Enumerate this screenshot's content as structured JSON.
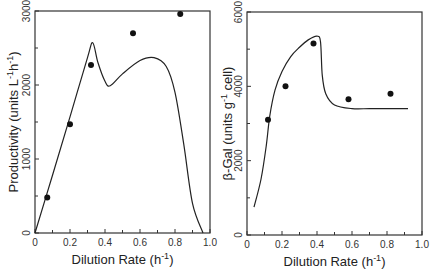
{
  "chart_data": [
    {
      "type": "line",
      "title": "",
      "xlabel": "Dilution Rate (h⁻¹)",
      "ylabel": "Productivity (units L⁻¹h⁻¹)",
      "xlim": [
        0,
        1.0
      ],
      "ylim": [
        0,
        3000
      ],
      "xticks": [
        "0",
        "0.2",
        "0.4",
        "0.6",
        "0.8",
        "1.0"
      ],
      "yticks": [
        "0",
        "1000",
        "2000",
        "3000"
      ],
      "grid": false,
      "series": [
        {
          "name": "model curve",
          "kind": "line",
          "x": [
            0,
            0.1,
            0.2,
            0.3,
            0.33,
            0.36,
            0.4,
            0.43,
            0.5,
            0.6,
            0.68,
            0.75,
            0.8,
            0.85,
            0.9,
            0.96
          ],
          "y": [
            0,
            780,
            1570,
            2370,
            2570,
            2300,
            2050,
            1990,
            2150,
            2330,
            2370,
            2250,
            1900,
            1200,
            400,
            0
          ]
        },
        {
          "name": "experimental data",
          "kind": "scatter",
          "x": [
            0.07,
            0.2,
            0.32,
            0.56,
            0.83
          ],
          "y": [
            480,
            1470,
            2270,
            2700,
            2960
          ]
        }
      ]
    },
    {
      "type": "line",
      "title": "",
      "xlabel": "Dilution Rate (h⁻¹)",
      "ylabel": "β-Gal (units g⁻¹ cell)",
      "xlim": [
        0,
        1.0
      ],
      "ylim": [
        0,
        6000
      ],
      "xticks": [
        "0",
        "0.2",
        "0.4",
        "0.6",
        "0.8",
        "1.0"
      ],
      "yticks": [
        "0",
        "2000",
        "4000",
        "6000"
      ],
      "grid": false,
      "series": [
        {
          "name": "model curve",
          "kind": "line",
          "x": [
            0.04,
            0.08,
            0.11,
            0.13,
            0.16,
            0.2,
            0.25,
            0.3,
            0.35,
            0.4,
            0.42,
            0.43,
            0.45,
            0.5,
            0.6,
            0.7,
            0.8,
            0.92
          ],
          "y": [
            750,
            1500,
            2400,
            3200,
            3900,
            4400,
            4800,
            5050,
            5250,
            5350,
            5200,
            4300,
            3800,
            3500,
            3400,
            3400,
            3400,
            3400
          ]
        },
        {
          "name": "experimental data",
          "kind": "scatter",
          "x": [
            0.12,
            0.22,
            0.38,
            0.58,
            0.82
          ],
          "y": [
            3100,
            4000,
            5150,
            3650,
            3800
          ]
        }
      ]
    }
  ],
  "labels": {
    "left_ylabel": "Productivity (units L",
    "left_ylabel_sup1": "-1",
    "left_ylabel_mid": "h",
    "left_ylabel_sup2": "-1",
    "left_ylabel_end": ")",
    "right_ylabel": "β-Gal (units g",
    "right_ylabel_sup": "-1",
    "right_ylabel_end": " cell)",
    "xlabel": "Dilution Rate (h",
    "xlabel_sup": "-1",
    "xlabel_end": ")"
  }
}
